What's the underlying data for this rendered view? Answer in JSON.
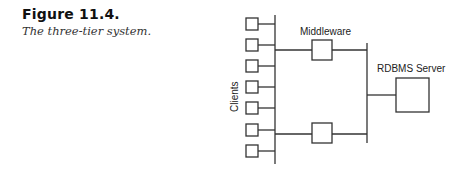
{
  "caption": {
    "figure_number": "Figure 11.4.",
    "title": "The three-tier system."
  },
  "diagram": {
    "labels": {
      "clients": "Clients",
      "middleware": "Middleware",
      "server": "RDBMS Server"
    },
    "client_count": 7,
    "middleware_count": 2,
    "server_count": 1,
    "stroke_color": "#333333"
  }
}
